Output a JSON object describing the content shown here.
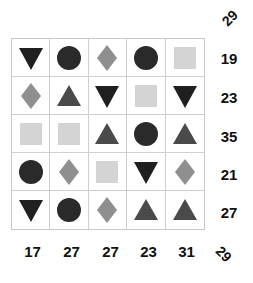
{
  "puzzle": {
    "colors": {
      "circle": "#2a2a2a",
      "triangle_down": "#1f1f1f",
      "triangle_up": "#4a4a4a",
      "diamond": "#8f8f8f",
      "square": "#d4d4d4"
    },
    "grid": [
      [
        "triangle_down",
        "circle",
        "diamond",
        "circle",
        "square"
      ],
      [
        "diamond",
        "triangle_up",
        "triangle_down",
        "square",
        "triangle_down"
      ],
      [
        "square",
        "square",
        "triangle_up",
        "circle",
        "triangle_up"
      ],
      [
        "circle",
        "diamond",
        "square",
        "triangle_down",
        "diamond"
      ],
      [
        "triangle_down",
        "circle",
        "diamond",
        "triangle_up",
        "triangle_up"
      ]
    ],
    "row_sums": [
      "19",
      "23",
      "35",
      "21",
      "27"
    ],
    "col_sums": [
      "17",
      "27",
      "27",
      "23",
      "31"
    ],
    "diag_top": "29",
    "diag_bottom": "29"
  }
}
